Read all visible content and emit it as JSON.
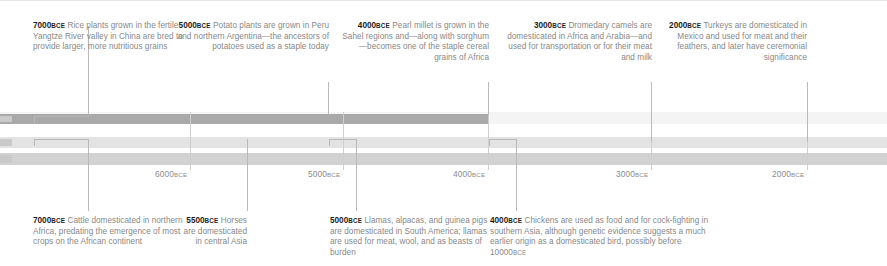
{
  "figure": {
    "type": "timeline",
    "colors": {
      "band_dark": "#a9a9aa",
      "band_light": "#e3e3e3",
      "band_mid": "#d2d2d2",
      "connector": "#b9b9b9",
      "text_body": "#87878a",
      "text_year": "#1d1d1d",
      "axis_label": "#8d8d8d"
    }
  },
  "axis": {
    "label_era": "BCE",
    "ticks": [
      {
        "year": "6000",
        "era": "BCE",
        "x": 190
      },
      {
        "year": "5000",
        "era": "BCE",
        "x": 343
      },
      {
        "year": "4000",
        "era": "BCE",
        "x": 488
      },
      {
        "year": "3000",
        "era": "BCE",
        "x": 651
      },
      {
        "year": "2000",
        "era": "BCE",
        "x": 807
      }
    ]
  },
  "top_callouts": [
    {
      "year": "7000",
      "era": "BCE",
      "text": "Rice plants grown in the fertile Yangtze River valley in China are bred to provide larger, more nutritious grains",
      "align": "left"
    },
    {
      "year": "5000",
      "era": "BCE",
      "text": "Potato plants are grown in Peru and northern Argentina—the ancestors of potatoes used as a staple today",
      "align": "right"
    },
    {
      "year": "4000",
      "era": "BCE",
      "text": "Pearl millet is grown in the Sahel regions and—along with sorghum—becomes one of the staple cereal grains of Africa",
      "align": "right"
    },
    {
      "year": "3000",
      "era": "BCE",
      "text": "Dromedary camels are domesticated in Africa and Arabia—and used for transportation or for their meat and milk",
      "align": "right"
    },
    {
      "year": "2000",
      "era": "BCE",
      "text": "Turkeys are domesticated in Mexico and used for meat and their feathers, and later have ceremonial significance",
      "align": "right"
    }
  ],
  "bottom_callouts": [
    {
      "year": "7000",
      "era": "BCE",
      "text": "Cattle domesticated in northern Africa, predating the emergence of most crops on the African continent",
      "align": "left"
    },
    {
      "year": "5500",
      "era": "BCE",
      "text": "Horses are domesticated in central Asia",
      "align": "right"
    },
    {
      "year": "5000",
      "era": "BCE",
      "text": "Llamas, alpacas, and guinea pigs are domesticated in South America; llamas are used for meat, wool, and as beasts of burden",
      "align": "left"
    },
    {
      "year": "4000",
      "era": "BCE",
      "text": "Chickens are used as food and for cock-fighting in southern Asia, although genetic evidence suggests a much earlier origin as a domesticated bird, possibly before ",
      "text_tail_year": "10000",
      "text_tail_era": "BCE",
      "align": "left"
    }
  ]
}
